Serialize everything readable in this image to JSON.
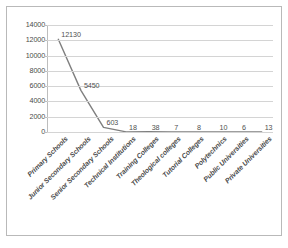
{
  "chart_data": {
    "type": "line",
    "title": "",
    "subtitle": "",
    "xlabel": "",
    "ylabel": "",
    "categories": [
      "Primary Schools",
      "Junior Secondary Schools",
      "Senior Secondary Schools",
      "Technical Institutions",
      "Training Colleges",
      "Theological colleges",
      "Tutorial Colleges",
      "Polytechnics",
      "Public Universities",
      "Private Universities"
    ],
    "values": [
      12130,
      5450,
      603,
      18,
      38,
      7,
      8,
      10,
      6,
      13
    ],
    "data_labels": [
      "12130",
      "5450",
      "603",
      "18",
      "38",
      "7",
      "8",
      "10",
      "6",
      "13"
    ],
    "ylim": [
      0,
      14000
    ],
    "yticks": [
      14000,
      12000,
      10000,
      8000,
      6000,
      4000,
      2000,
      0
    ],
    "ytick_labels": [
      "14000",
      "12000",
      "10000",
      "8000",
      "6000",
      "4000",
      "2000",
      "0"
    ],
    "grid": true,
    "legend": false,
    "legend_position": "none",
    "series_color": "#7f7f7f",
    "gridline_color": "#d4d4d4",
    "axis_color": "#bdbdbd",
    "text_color": "#4a4a4a",
    "background_color": "#ffffff",
    "border_color": "#b9b9b9"
  }
}
